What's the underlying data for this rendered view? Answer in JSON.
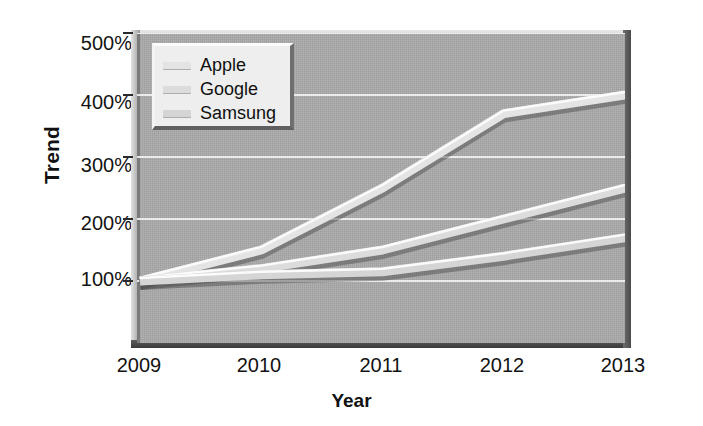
{
  "chart_data": {
    "type": "line",
    "title": "",
    "xlabel": "Year",
    "ylabel": "Trend",
    "x": [
      "2009",
      "2010",
      "2011",
      "2012",
      "2013"
    ],
    "categories": [
      "2009",
      "2010",
      "2011",
      "2012",
      "2013"
    ],
    "xtick_labels": [
      "2009",
      "2010",
      "2011",
      "2012",
      "2013"
    ],
    "ytick_labels": [
      "100%",
      "200%",
      "300%",
      "400%",
      "500%"
    ],
    "ytick_values": [
      100,
      200,
      300,
      400,
      500
    ],
    "ylim": [
      0,
      500
    ],
    "yunit": "%",
    "grid": true,
    "grid_color": "#f1f1f1",
    "legend_position": "top-left",
    "plot_background": "#a9a9a9",
    "series": [
      {
        "name": "Apple",
        "color": "#e4e4e4",
        "values": [
          100,
          150,
          250,
          370,
          400
        ]
      },
      {
        "name": "Google",
        "color": "#dcdcdc",
        "values": [
          100,
          120,
          150,
          200,
          250
        ]
      },
      {
        "name": "Samsung",
        "color": "#d5d5d5",
        "values": [
          100,
          110,
          115,
          140,
          170
        ]
      }
    ]
  },
  "axes": {
    "y_title": "Trend",
    "x_title": "Year",
    "y_ticks": [
      {
        "label": "500%"
      },
      {
        "label": "400%"
      },
      {
        "label": "300%"
      },
      {
        "label": "200%"
      },
      {
        "label": "100%"
      }
    ],
    "x_ticks": [
      {
        "label": "2009"
      },
      {
        "label": "2010"
      },
      {
        "label": "2011"
      },
      {
        "label": "2012"
      },
      {
        "label": "2013"
      }
    ]
  },
  "legend": {
    "items": [
      {
        "label": "Apple",
        "color": "#e4e4e4"
      },
      {
        "label": "Google",
        "color": "#dcdcdc"
      },
      {
        "label": "Samsung",
        "color": "#d5d5d5"
      }
    ]
  }
}
